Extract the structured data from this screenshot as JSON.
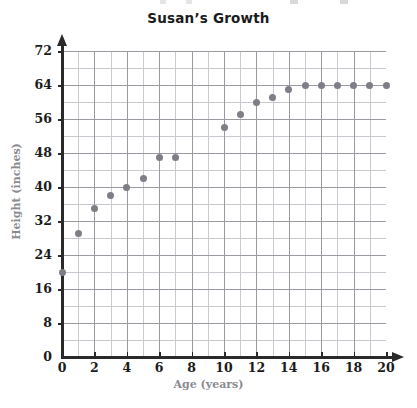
{
  "chart_data": {
    "type": "scatter",
    "title": "Susan’s Growth",
    "xlabel": "Age (years)",
    "ylabel": "Height (inches)",
    "xlim": [
      0,
      20
    ],
    "ylim": [
      0,
      72
    ],
    "x_ticks": [
      "0",
      "2",
      "4",
      "6",
      "8",
      "10",
      "12",
      "14",
      "16",
      "18",
      "20"
    ],
    "y_ticks": [
      "0",
      "8",
      "16",
      "24",
      "32",
      "40",
      "48",
      "56",
      "64",
      "72"
    ],
    "x_tick_values": [
      0,
      2,
      4,
      6,
      8,
      10,
      12,
      14,
      16,
      18,
      20
    ],
    "y_tick_values": [
      0,
      8,
      16,
      24,
      32,
      40,
      48,
      56,
      64,
      72
    ],
    "grid": true,
    "grid_minor_x_step": 1,
    "grid_minor_y_step": 4,
    "legend": "none",
    "marker_color": "#7e7e86",
    "axis_color": "#2a2a2a",
    "grid_color": "#c9c9cf",
    "grid_major_color": "#9a9aa2",
    "label_color": "#8a8a90",
    "x": [
      0,
      1,
      2,
      3,
      4,
      5,
      6,
      7,
      10,
      11,
      12,
      13,
      14,
      15,
      16,
      17,
      18,
      19,
      20
    ],
    "y": [
      20,
      29,
      35,
      38,
      40,
      42,
      47,
      47,
      54,
      57,
      60,
      61,
      63,
      64,
      64,
      64,
      64,
      64,
      64
    ],
    "points": [
      {
        "age": 0,
        "height": 20
      },
      {
        "age": 1,
        "height": 29
      },
      {
        "age": 2,
        "height": 35
      },
      {
        "age": 3,
        "height": 38
      },
      {
        "age": 4,
        "height": 40
      },
      {
        "age": 5,
        "height": 42
      },
      {
        "age": 6,
        "height": 47
      },
      {
        "age": 7,
        "height": 47
      },
      {
        "age": 10,
        "height": 54
      },
      {
        "age": 11,
        "height": 57
      },
      {
        "age": 12,
        "height": 60
      },
      {
        "age": 13,
        "height": 61
      },
      {
        "age": 14,
        "height": 63
      },
      {
        "age": 15,
        "height": 64
      },
      {
        "age": 16,
        "height": 64
      },
      {
        "age": 17,
        "height": 64
      },
      {
        "age": 18,
        "height": 64
      },
      {
        "age": 19,
        "height": 64
      },
      {
        "age": 20,
        "height": 64
      }
    ]
  }
}
